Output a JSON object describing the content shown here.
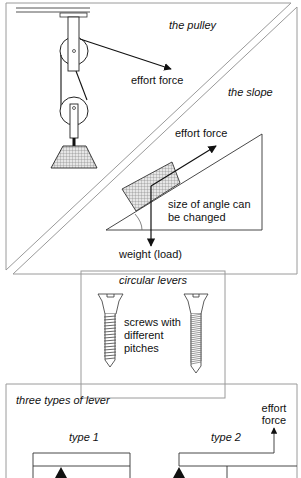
{
  "panels": {
    "pulley": {
      "title": "the pulley",
      "effort_label": "effort force"
    },
    "slope": {
      "title": "the slope",
      "effort_label": "effort force",
      "angle_note_line1": "size of angle can",
      "angle_note_line2": "be changed",
      "weight_label": "weight (load)"
    },
    "screws": {
      "title": "circular levers",
      "note_line1": "screws with",
      "note_line2": "different",
      "note_line3": "pitches"
    },
    "levers": {
      "title": "three types of lever",
      "type1_label": "type 1",
      "type2_label": "type 2",
      "effort_line1": "effort",
      "effort_line2": "force"
    }
  },
  "colors": {
    "line": "#111111",
    "frame": "#9a9a9a",
    "hatch": "#bdbdbd"
  }
}
